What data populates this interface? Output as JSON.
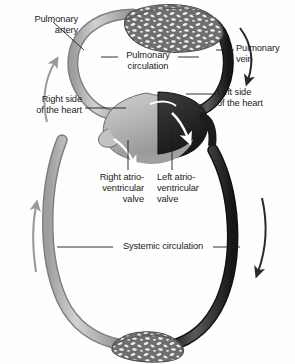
{
  "figure": {
    "background_color": "#fefefe",
    "text_color": "#1c1c1c"
  },
  "colors": {
    "deoxygenated_vessel": "#b2b2b2",
    "deoxygenated_vessel_edge": "#8a8a8a",
    "oxygenated_vessel": "#3c3c3c",
    "oxygenated_vessel_edge": "#222222",
    "heart_right": "#b8b8b8",
    "heart_left": "#2e2e2e",
    "capillary_bed": "#6f6f6f",
    "capillary_speckle": "#f2f2f2",
    "flow_arrow_light": "#9a9a9a",
    "flow_arrow_dark": "#2a2a2a",
    "flow_arrow_white": "#ffffff",
    "leader_line": "#1c1c1c"
  },
  "labels": {
    "pulmonary_artery": "Pulmonary\nartery",
    "pulmonary_circulation": "Pulmonary\ncirculation",
    "pulmonary_vein": "Pulmonary\nvein",
    "right_side_of_heart": "Right side\nof the heart",
    "left_side_of_heart": "Left side\nof the heart",
    "right_av_valve": "Right atrio-\nventricular\nvalve",
    "left_av_valve": "Left atrio-\nventricular\nvalve",
    "systemic_circulation": "Systemic circulation"
  },
  "diagram_parts": {
    "pulmonary_capillary_bed": "lung-capillary-bed",
    "systemic_capillary_bed": "systemic-capillary-bed",
    "heart": "heart",
    "right_heart_chamber": "right-heart-chamber",
    "left_heart_chamber": "left-heart-chamber"
  },
  "flow_arrows": [
    {
      "name": "pulmonary-artery-flow-arrow",
      "direction": "up",
      "shade": "light"
    },
    {
      "name": "pulmonary-vein-flow-arrow",
      "direction": "down",
      "shade": "dark"
    },
    {
      "name": "systemic-vein-flow-arrow",
      "direction": "up",
      "shade": "light"
    },
    {
      "name": "systemic-artery-flow-arrow",
      "direction": "down",
      "shade": "dark"
    },
    {
      "name": "right-av-valve-flow-arrow",
      "direction": "down-right",
      "shade": "white"
    },
    {
      "name": "left-av-valve-flow-arrow",
      "direction": "down-right",
      "shade": "white"
    }
  ]
}
